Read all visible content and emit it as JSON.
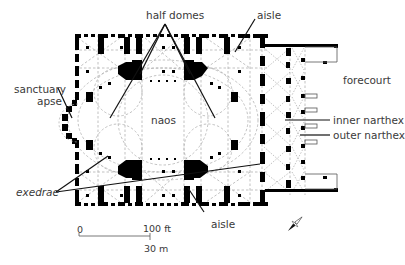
{
  "diagram": {
    "type": "architectural floor plan",
    "labels": {
      "half_domes": "half domes",
      "aisle_top": "aisle",
      "sanctuary_apse_line1": "sanctuary",
      "sanctuary_apse_line2": "apse",
      "naos": "naos",
      "forecourt": "forecourt",
      "inner_narthex": "inner narthex",
      "outer_narthex": "outer narthex",
      "exedrae": "exedrae",
      "aisle_bottom": "aisle"
    },
    "scale_bar": {
      "start_label": "0",
      "feet_label": "100 ft",
      "meters_label": "30 m"
    },
    "compass": "north-arrow",
    "colors": {
      "walls": "#000000",
      "dashed_lines": "#a8a8a8",
      "leader_lines": "#111111",
      "text": "#3a3a3a",
      "background": "#ffffff"
    }
  }
}
